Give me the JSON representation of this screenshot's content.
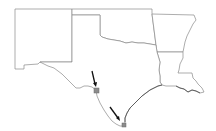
{
  "map": {
    "type": "state outline map",
    "regions": [
      {
        "id": "new-mexico",
        "label": "New Mexico"
      },
      {
        "id": "texas",
        "label": "Texas"
      },
      {
        "id": "oklahoma",
        "label": "Oklahoma"
      },
      {
        "id": "arkansas",
        "label": "Arkansas"
      },
      {
        "id": "louisiana",
        "label": "Louisiana"
      }
    ],
    "colors": {
      "background": "#ffffff",
      "border": "#8a8a8a",
      "marker": "#8c8c8c",
      "arrow": "#111111"
    },
    "markers": [
      {
        "id": "marker-rio-grande",
        "x": 96,
        "y": 90,
        "size": 5
      },
      {
        "id": "marker-south-tip",
        "x": 124,
        "y": 125,
        "size": 4
      }
    ]
  }
}
